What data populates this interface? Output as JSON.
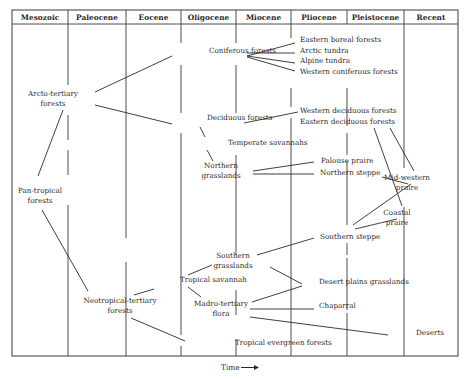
{
  "diagram": {
    "type": "phylogenetic-vegetation-tree",
    "frame": {
      "left": 12,
      "top": 10,
      "right": 458,
      "header_bottom": 24,
      "bottom": 356
    },
    "columns": [
      {
        "label": "Mesozoic",
        "x0": 12,
        "x1": 68
      },
      {
        "label": "Paleocene",
        "x0": 68,
        "x1": 126
      },
      {
        "label": "Eocene",
        "x0": 126,
        "x1": 181
      },
      {
        "label": "Oligocene",
        "x0": 181,
        "x1": 236
      },
      {
        "label": "Miocene",
        "x0": 236,
        "x1": 291
      },
      {
        "label": "Pliocene",
        "x0": 291,
        "x1": 347
      },
      {
        "label": "Pleistocene",
        "x0": 347,
        "x1": 404
      },
      {
        "label": "Recent",
        "x0": 404,
        "x1": 458
      }
    ],
    "column_gaps": [
      {
        "x": 68,
        "gaps": [
          [
            85,
            115
          ],
          [
            140,
            150
          ],
          [
            175,
            205
          ]
        ]
      },
      {
        "x": 126,
        "gaps": [
          [
            238,
            262
          ]
        ]
      },
      {
        "x": 181,
        "gaps": [
          [
            43,
            65
          ],
          [
            113,
            133
          ],
          [
            335,
            346
          ]
        ]
      },
      {
        "x": 236,
        "gaps": [
          [
            43,
            65
          ],
          [
            113,
            155
          ],
          [
            255,
            290
          ],
          [
            315,
            339
          ]
        ]
      },
      {
        "x": 291,
        "gaps": [
          [
            38,
            88
          ],
          [
            107,
            118
          ]
        ]
      },
      {
        "x": 347,
        "gaps": [
          [
            24,
            88
          ],
          [
            126,
            133
          ],
          [
            155,
            161
          ],
          [
            225,
            243
          ],
          [
            255,
            258
          ],
          [
            310,
            313
          ]
        ]
      },
      {
        "x": 404,
        "gaps": [
          [
            168,
            207
          ]
        ]
      }
    ],
    "nodes": [
      {
        "id": "arcto",
        "lines": [
          "Arcto-tertiary",
          "forests"
        ],
        "x": 53,
        "y": 96
      },
      {
        "id": "pantrop",
        "lines": [
          "Pan-tropical",
          "forests"
        ],
        "x": 40,
        "y": 193
      },
      {
        "id": "conif",
        "lines": [
          "Coniferous forests"
        ],
        "x": 209,
        "y": 53
      },
      {
        "id": "decid",
        "lines": [
          "Deciduous forests"
        ],
        "x": 207,
        "y": 120
      },
      {
        "id": "tempsav",
        "lines": [
          "Temperate savannahs"
        ],
        "x": 228,
        "y": 145
      },
      {
        "id": "northgr",
        "lines": [
          "Northern",
          "grasslands"
        ],
        "x": 221,
        "y": 168
      },
      {
        "id": "eboreal",
        "lines": [
          "Eastern boreal forests"
        ],
        "x": 300,
        "y": 42
      },
      {
        "id": "arctic",
        "lines": [
          "Arctic tundra"
        ],
        "x": 300,
        "y": 53
      },
      {
        "id": "alpine",
        "lines": [
          "Alpine tundra"
        ],
        "x": 300,
        "y": 63
      },
      {
        "id": "wconif",
        "lines": [
          "Western coniferous forests"
        ],
        "x": 300,
        "y": 74
      },
      {
        "id": "wdecid",
        "lines": [
          "Western deciduous forests"
        ],
        "x": 300,
        "y": 113
      },
      {
        "id": "edecid",
        "lines": [
          "Eastern deciduous forests"
        ],
        "x": 300,
        "y": 124
      },
      {
        "id": "palouse",
        "lines": [
          "Palouse praire"
        ],
        "x": 321,
        "y": 163
      },
      {
        "id": "nsteppe",
        "lines": [
          "Northern steppe"
        ],
        "x": 320,
        "y": 175
      },
      {
        "id": "midwest",
        "lines": [
          "Mid-western",
          "praire"
        ],
        "x": 407,
        "y": 180
      },
      {
        "id": "coastal",
        "lines": [
          "Coastal",
          "praire"
        ],
        "x": 397,
        "y": 215
      },
      {
        "id": "ssteppe",
        "lines": [
          "Southern steppe"
        ],
        "x": 320,
        "y": 239
      },
      {
        "id": "southgr",
        "lines": [
          "Southern",
          "grasslands"
        ],
        "x": 233,
        "y": 258
      },
      {
        "id": "tropsav",
        "lines": [
          "Tropical savannah"
        ],
        "x": 180,
        "y": 282
      },
      {
        "id": "neotrop",
        "lines": [
          "Neotropical-tertiary",
          "forests"
        ],
        "x": 120,
        "y": 303
      },
      {
        "id": "madro",
        "lines": [
          "Madro-tertiary",
          "flora"
        ],
        "x": 221,
        "y": 306
      },
      {
        "id": "desertpl",
        "lines": [
          "Desert plains grasslands"
        ],
        "x": 319,
        "y": 284
      },
      {
        "id": "chaparral",
        "lines": [
          "Chaparral"
        ],
        "x": 319,
        "y": 308
      },
      {
        "id": "deserts",
        "lines": [
          "Deserts"
        ],
        "x": 416,
        "y": 335
      },
      {
        "id": "tropever",
        "lines": [
          "Tropical evergreen forests"
        ],
        "x": 235,
        "y": 345
      }
    ],
    "edges": [
      [
        95,
        92,
        172,
        56
      ],
      [
        95,
        105,
        172,
        124
      ],
      [
        63,
        110,
        38,
        176
      ],
      [
        42,
        210,
        88,
        291
      ],
      [
        247,
        56,
        295,
        43
      ],
      [
        247,
        53,
        295,
        53
      ],
      [
        247,
        56,
        295,
        63
      ],
      [
        247,
        57,
        295,
        71
      ],
      [
        244,
        123,
        298,
        112
      ],
      [
        200,
        127,
        205,
        137
      ],
      [
        207,
        150,
        213,
        161
      ],
      [
        253,
        171,
        314,
        162
      ],
      [
        253,
        174,
        314,
        174
      ],
      [
        382,
        177,
        408,
        184
      ],
      [
        374,
        128,
        402,
        206
      ],
      [
        390,
        128,
        414,
        171
      ],
      [
        353,
        225,
        411,
        184
      ],
      [
        355,
        229,
        397,
        219
      ],
      [
        257,
        255,
        314,
        238
      ],
      [
        188,
        275,
        212,
        265
      ],
      [
        134,
        295,
        154,
        289
      ],
      [
        188,
        287,
        201,
        297
      ],
      [
        131,
        318,
        185,
        341
      ],
      [
        252,
        302,
        302,
        286
      ],
      [
        270,
        267,
        302,
        284
      ],
      [
        250,
        309,
        314,
        309
      ],
      [
        250,
        317,
        388,
        335
      ]
    ],
    "axis": {
      "label": "Time",
      "arrow": "→",
      "x": 233,
      "y": 370
    }
  }
}
